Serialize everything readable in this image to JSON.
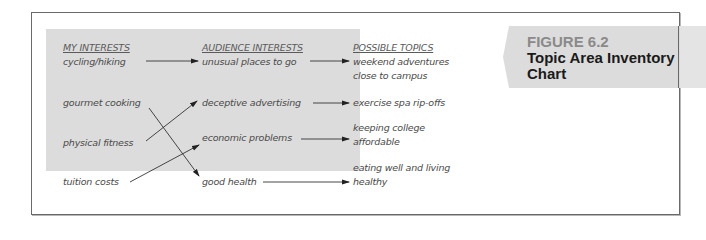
{
  "figure": {
    "number": "FIGURE 6.2",
    "title_line1": "Topic Area Inventory",
    "title_line2": "Chart"
  },
  "columns": {
    "my_interests": "MY INTERESTS",
    "audience_interests": "AUDIENCE INTERESTS",
    "possible_topics": "POSSIBLE TOPICS"
  },
  "my_interests": [
    "cycling/hiking",
    "gourmet cooking",
    "physical fitness",
    "tuition costs"
  ],
  "audience_interests": [
    "unusual places to go",
    "deceptive advertising",
    "economic problems",
    "good health"
  ],
  "possible_topics": [
    {
      "line1": "weekend adventures",
      "line2": "close to campus"
    },
    {
      "line1": "exercise spa rip-offs",
      "line2": ""
    },
    {
      "line1": "keeping college",
      "line2": "affordable"
    },
    {
      "line1": "eating well and living",
      "line2": "healthy"
    }
  ],
  "links": [
    {
      "from": "cycling/hiking",
      "to": "unusual places to go"
    },
    {
      "from": "gourmet cooking",
      "to": "good health"
    },
    {
      "from": "physical fitness",
      "to": "deceptive advertising"
    },
    {
      "from": "tuition costs",
      "to": "economic problems"
    },
    {
      "from": "unusual places to go",
      "to": "weekend adventures close to campus"
    },
    {
      "from": "deceptive advertising",
      "to": "exercise spa rip-offs"
    },
    {
      "from": "economic problems",
      "to": "keeping college affordable"
    },
    {
      "from": "good health",
      "to": "eating well and living healthy"
    }
  ],
  "colors": {
    "panel": "#dcdcdc",
    "banner": "#dcdcdc",
    "figure_number": "#8a8a8a",
    "frame_border": "#6a6a6a"
  }
}
